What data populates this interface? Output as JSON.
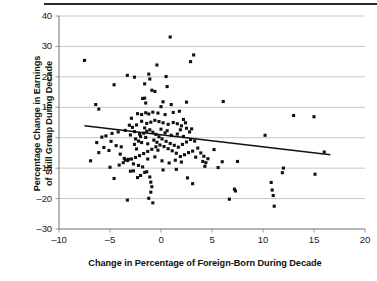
{
  "chart_data": {
    "type": "scatter",
    "title": "",
    "xlabel": "Change in Percentage of Foreign-Born During Decade",
    "ylabel": "Percentage Change in Earnings of Skill Group During Decade",
    "ylabel_line1": "Percentage Change in Earnings",
    "ylabel_line2": "of Skill Group During Decade",
    "xlim": [
      -10,
      20
    ],
    "ylim": [
      -30,
      40
    ],
    "xticks": [
      -10,
      -5,
      0,
      5,
      10,
      15,
      20
    ],
    "xtick_labels": [
      "–10",
      "–5",
      "0",
      "5",
      "10",
      "15",
      "20"
    ],
    "yticks": [
      -30,
      -20,
      -10,
      0,
      10,
      20,
      30,
      40
    ],
    "ytick_labels": [
      "–30",
      "–20",
      "–10",
      "0",
      "10",
      "20",
      "30",
      "40"
    ],
    "grid": "horizontal",
    "legend": "none",
    "marker_color": "#111111",
    "grid_color": "#b9b9b9",
    "trendline": {
      "type": "linear-fit",
      "color": "#111111",
      "x_start": -7.5,
      "y_start": 3.9,
      "x_end": 16.6,
      "y_end": -5.6,
      "slope": -0.394,
      "intercept": 0.94
    },
    "points": [
      [
        -7.5,
        25.4
      ],
      [
        -4.6,
        17.4
      ],
      [
        -6.4,
        10.9
      ],
      [
        -6.1,
        9.4
      ],
      [
        -3.3,
        20.5
      ],
      [
        -2.6,
        19.9
      ],
      [
        -1.6,
        17.7
      ],
      [
        -1.2,
        20.9
      ],
      [
        -1.1,
        19.3
      ],
      [
        -0.9,
        15.6
      ],
      [
        -0.6,
        15.2
      ],
      [
        -0.4,
        23.9
      ],
      [
        0.5,
        20.1
      ],
      [
        0.9,
        33.1
      ],
      [
        0.6,
        16.8
      ],
      [
        1.0,
        10.9
      ],
      [
        0.2,
        11.8
      ],
      [
        0.0,
        10.2
      ],
      [
        2.9,
        25.0
      ],
      [
        3.2,
        27.2
      ],
      [
        2.5,
        11.7
      ],
      [
        6.1,
        11.9
      ],
      [
        -1.8,
        12.9
      ],
      [
        -1.5,
        11.4
      ],
      [
        -1.6,
        13.0
      ],
      [
        -2.3,
        7.9
      ],
      [
        -2.9,
        6.4
      ],
      [
        -1.9,
        7.6
      ],
      [
        -1.5,
        8.2
      ],
      [
        -1.2,
        7.8
      ],
      [
        -0.8,
        8.4
      ],
      [
        -0.3,
        8.1
      ],
      [
        0.4,
        7.6
      ],
      [
        1.2,
        8.3
      ],
      [
        1.8,
        8.7
      ],
      [
        2.2,
        6.0
      ],
      [
        2.4,
        4.9
      ],
      [
        2.0,
        3.9
      ],
      [
        1.6,
        4.6
      ],
      [
        1.2,
        5.0
      ],
      [
        0.7,
        4.4
      ],
      [
        0.2,
        4.9
      ],
      [
        -0.2,
        5.3
      ],
      [
        -0.6,
        5.7
      ],
      [
        -1.0,
        5.1
      ],
      [
        -1.4,
        4.7
      ],
      [
        -1.9,
        5.4
      ],
      [
        -2.4,
        4.2
      ],
      [
        -2.8,
        3.4
      ],
      [
        -3.1,
        4.1
      ],
      [
        -3.5,
        2.4
      ],
      [
        -4.2,
        1.9
      ],
      [
        -4.8,
        1.4
      ],
      [
        -5.4,
        0.6
      ],
      [
        -6.3,
        -1.6
      ],
      [
        -6.9,
        -7.6
      ],
      [
        -6.1,
        -4.9
      ],
      [
        -5.6,
        -3.2
      ],
      [
        -5.0,
        -9.7
      ],
      [
        -4.6,
        -13.4
      ],
      [
        -4.0,
        -5.4
      ],
      [
        -3.6,
        -6.8
      ],
      [
        -3.5,
        -7.3
      ],
      [
        -3.2,
        -7.1
      ],
      [
        -3.3,
        -20.5
      ],
      [
        -3.0,
        -11.0
      ],
      [
        -2.7,
        -10.9
      ],
      [
        -2.4,
        -3.7
      ],
      [
        -2.6,
        -2.2
      ],
      [
        -2.2,
        -1.1
      ],
      [
        -2.0,
        0.4
      ],
      [
        -1.7,
        1.5
      ],
      [
        -1.4,
        2.1
      ],
      [
        -1.1,
        2.6
      ],
      [
        -0.8,
        1.8
      ],
      [
        -0.5,
        1.1
      ],
      [
        -0.2,
        0.3
      ],
      [
        0.1,
        -0.4
      ],
      [
        0.5,
        -1.2
      ],
      [
        0.9,
        -1.9
      ],
      [
        1.3,
        -2.5
      ],
      [
        1.7,
        -3.1
      ],
      [
        2.1,
        -2.2
      ],
      [
        2.5,
        -1.4
      ],
      [
        2.9,
        -0.6
      ],
      [
        3.3,
        -1.1
      ],
      [
        3.6,
        -3.4
      ],
      [
        3.9,
        -5.0
      ],
      [
        4.2,
        -6.1
      ],
      [
        3.4,
        -6.4
      ],
      [
        3.1,
        -4.4
      ],
      [
        2.7,
        -4.9
      ],
      [
        2.3,
        -5.6
      ],
      [
        1.9,
        -6.2
      ],
      [
        1.5,
        -5.1
      ],
      [
        1.1,
        -4.3
      ],
      [
        0.7,
        -3.6
      ],
      [
        0.3,
        -2.9
      ],
      [
        -0.1,
        -2.4
      ],
      [
        -0.5,
        -3.0
      ],
      [
        -0.9,
        -3.8
      ],
      [
        -1.3,
        -4.5
      ],
      [
        -1.7,
        -5.2
      ],
      [
        -2.1,
        -5.9
      ],
      [
        -2.5,
        -6.5
      ],
      [
        -2.9,
        -7.0
      ],
      [
        -3.3,
        -7.5
      ],
      [
        -3.7,
        -8.2
      ],
      [
        -2.7,
        -8.6
      ],
      [
        -2.2,
        -9.1
      ],
      [
        -1.8,
        -9.6
      ],
      [
        -1.4,
        -11.2
      ],
      [
        -1.1,
        -12.9
      ],
      [
        -1.0,
        -14.6
      ],
      [
        -0.9,
        -16.1
      ],
      [
        -1.0,
        -17.9
      ],
      [
        -0.8,
        -21.4
      ],
      [
        -1.2,
        -19.9
      ],
      [
        -2.3,
        -13.1
      ],
      [
        -1.6,
        -11.4
      ],
      [
        0.2,
        -10.6
      ],
      [
        1.5,
        -10.4
      ],
      [
        2.6,
        -13.2
      ],
      [
        3.1,
        -15.1
      ],
      [
        4.1,
        -7.8
      ],
      [
        4.4,
        -8.2
      ],
      [
        4.3,
        -9.4
      ],
      [
        4.6,
        -6.9
      ],
      [
        5.2,
        -3.9
      ],
      [
        5.6,
        -9.8
      ],
      [
        6.0,
        -7.9
      ],
      [
        6.7,
        -20.2
      ],
      [
        7.2,
        -16.9
      ],
      [
        7.3,
        -17.5
      ],
      [
        7.5,
        -7.8
      ],
      [
        10.2,
        0.8
      ],
      [
        10.9,
        -17.2
      ],
      [
        11.0,
        -19.0
      ],
      [
        11.1,
        -22.5
      ],
      [
        10.8,
        -14.7
      ],
      [
        11.9,
        -11.5
      ],
      [
        12.0,
        -10.0
      ],
      [
        13.0,
        7.3
      ],
      [
        15.0,
        6.9
      ],
      [
        15.1,
        -12.0
      ],
      [
        16.0,
        -4.7
      ],
      [
        -0.4,
        -1.5
      ],
      [
        0.0,
        2.8
      ],
      [
        -1.5,
        0.1
      ],
      [
        -2.1,
        1.2
      ],
      [
        -3.0,
        0.9
      ],
      [
        -2.5,
        -0.4
      ],
      [
        -1.9,
        -1.6
      ],
      [
        -1.3,
        -2.0
      ],
      [
        -0.7,
        -0.8
      ],
      [
        0.4,
        1.6
      ],
      [
        1.0,
        0.8
      ],
      [
        1.6,
        1.2
      ],
      [
        2.2,
        0.4
      ],
      [
        2.8,
        1.9
      ],
      [
        -4.4,
        -2.6
      ],
      [
        -5.1,
        -4.2
      ],
      [
        -4.1,
        -9.0
      ],
      [
        -3.9,
        -3.0
      ],
      [
        -2.0,
        -12.4
      ],
      [
        -1.3,
        -7.0
      ],
      [
        -0.6,
        -6.3
      ],
      [
        0.1,
        -7.6
      ],
      [
        0.8,
        -8.3
      ],
      [
        1.4,
        -7.4
      ],
      [
        2.0,
        -8.0
      ],
      [
        -0.3,
        -4.1
      ],
      [
        -1.6,
        3.2
      ],
      [
        -2.6,
        2.0
      ],
      [
        0.6,
        2.3
      ],
      [
        1.9,
        2.6
      ],
      [
        2.5,
        3.1
      ],
      [
        3.0,
        2.9
      ],
      [
        -5.8,
        0.2
      ],
      [
        -4.9,
        -1.2
      ]
    ]
  }
}
